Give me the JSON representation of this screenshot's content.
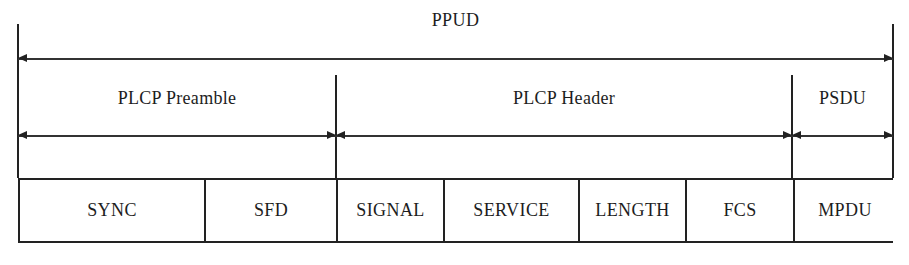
{
  "diagram": {
    "title": "PPUD",
    "geometry": {
      "left": 18,
      "right": 893,
      "divider_preamble_header": 336,
      "divider_header_psdu": 792,
      "title_arrow_y": 58,
      "section_arrow_y": 135,
      "box_top": 178,
      "box_bottom": 243,
      "vline_top": 24,
      "vline_section_top": 75
    },
    "sections": [
      {
        "label": "PLCP Preamble",
        "start": 18,
        "end": 336
      },
      {
        "label": "PLCP Header",
        "start": 336,
        "end": 792
      },
      {
        "label": "PSDU",
        "start": 792,
        "end": 893
      }
    ],
    "fields": [
      {
        "label": "SYNC",
        "start": 18,
        "end": 204
      },
      {
        "label": "SFD",
        "start": 204,
        "end": 336
      },
      {
        "label": "SIGNAL",
        "start": 336,
        "end": 443
      },
      {
        "label": "SERVICE",
        "start": 443,
        "end": 578
      },
      {
        "label": "LENGTH",
        "start": 578,
        "end": 685
      },
      {
        "label": "FCS",
        "start": 685,
        "end": 793
      },
      {
        "label": "MPDU",
        "start": 793,
        "end": 893
      }
    ],
    "colors": {
      "line": "#222222",
      "text": "#1d1d1d",
      "background": "#ffffff"
    }
  }
}
